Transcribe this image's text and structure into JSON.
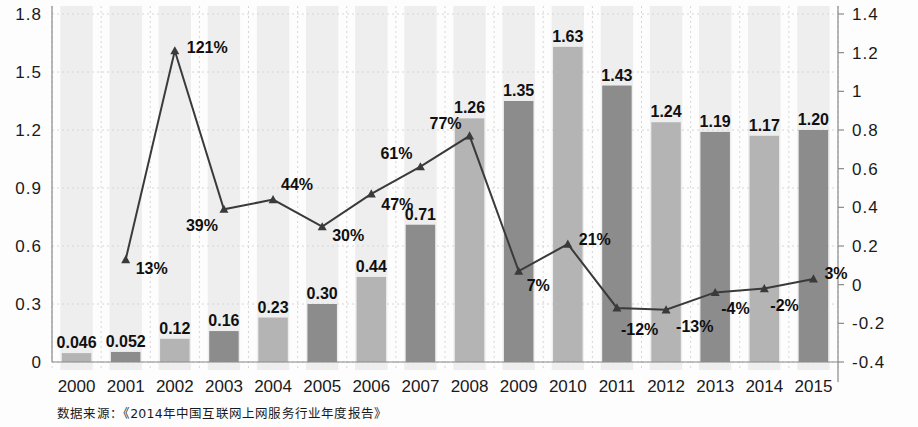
{
  "chart_data": {
    "type": "bar",
    "title": "",
    "subtitle": "",
    "xlabel": "",
    "ylabel": "",
    "categories": [
      "2000",
      "2001",
      "2002",
      "2003",
      "2004",
      "2005",
      "2006",
      "2007",
      "2008",
      "2009",
      "2010",
      "2011",
      "2012",
      "2013",
      "2014",
      "2015"
    ],
    "series": [
      {
        "name": "bars",
        "type": "bar",
        "axis": "left",
        "values": [
          0.046,
          0.052,
          0.12,
          0.16,
          0.23,
          0.3,
          0.44,
          0.71,
          1.26,
          1.35,
          1.63,
          1.43,
          1.24,
          1.19,
          1.17,
          1.2
        ],
        "labels": [
          "0.046",
          "0.052",
          "0.12",
          "0.16",
          "0.23",
          "0.30",
          "0.44",
          "0.71",
          "1.26",
          "1.35",
          "1.63",
          "1.43",
          "1.24",
          "1.19",
          "1.17",
          "1.20"
        ]
      },
      {
        "name": "growth",
        "type": "line",
        "axis": "right",
        "values": [
          null,
          0.13,
          1.21,
          0.39,
          0.44,
          0.3,
          0.47,
          0.61,
          0.77,
          0.07,
          0.21,
          -0.12,
          -0.13,
          -0.04,
          -0.02,
          0.03
        ],
        "labels": [
          null,
          "13%",
          "121%",
          "39%",
          "44%",
          "30%",
          "47%",
          "61%",
          "77%",
          "7%",
          "21%",
          "-12%",
          "-13%",
          "-4%",
          "-2%",
          "3%"
        ]
      }
    ],
    "left_axis": {
      "ticks": [
        "1.8",
        "1.5",
        "1.2",
        "0.9",
        "0.6",
        "0.3",
        "0"
      ],
      "values": [
        1.8,
        1.5,
        1.2,
        0.9,
        0.6,
        0.3,
        0
      ],
      "min": 0,
      "max": 1.8
    },
    "right_axis": {
      "ticks": [
        "1.4",
        "1.2",
        "1",
        "0.8",
        "0.6",
        "0.4",
        "0.2",
        "0",
        "-0.2",
        "-0.4"
      ],
      "values": [
        1.4,
        1.2,
        1.0,
        0.8,
        0.6,
        0.4,
        0.2,
        0,
        -0.2,
        -0.4
      ],
      "min": -0.4,
      "max": 1.4
    },
    "grid": true,
    "legend": "none",
    "colors": {
      "bar_dark": "#8c8c8c",
      "bar_light": "#b4b4b4",
      "line": "#3a3a3a",
      "band": "#eeeeee",
      "text": "#1a1a1a",
      "grid": "#d6d6d6",
      "axis": "#8a8a8a"
    }
  },
  "footer": {
    "source_text": "数据来源：《2014年中国互联网上网服务行业年度报告》"
  }
}
